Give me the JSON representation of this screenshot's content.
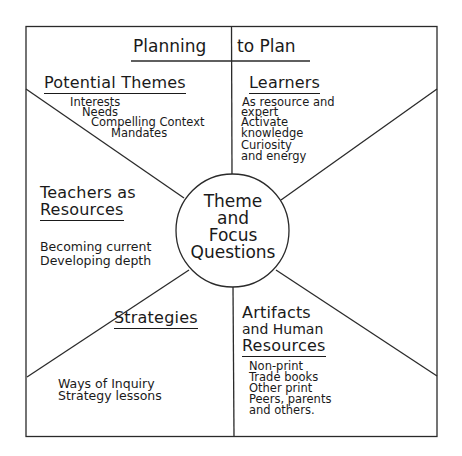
{
  "title": {
    "left": "Planning",
    "right": "to Plan"
  },
  "center": {
    "lines": [
      "Theme",
      "and",
      "Focus",
      "Questions"
    ]
  },
  "sections": {
    "potential_themes": {
      "heading": "Potential Themes",
      "items": [
        "Interests",
        "Needs",
        "Compelling Context",
        "Mandates"
      ]
    },
    "learners": {
      "heading": "Learners",
      "items": [
        "As resource and",
        "expert",
        "Activate",
        "knowledge",
        "Curiosity",
        "and energy"
      ]
    },
    "teachers": {
      "heading_line1": "Teachers as",
      "heading_line2": "Resources",
      "items": [
        "Becoming current",
        "Developing depth"
      ]
    },
    "strategies": {
      "heading": "Strategies",
      "items": [
        "Ways of Inquiry",
        "Strategy lessons"
      ]
    },
    "artifacts": {
      "heading_line1": "Artifacts",
      "heading_line2": "and Human",
      "heading_line3": "Resources",
      "items": [
        "Non-print",
        "Trade books",
        "Other print",
        "Peers, parents",
        "and others."
      ]
    }
  }
}
